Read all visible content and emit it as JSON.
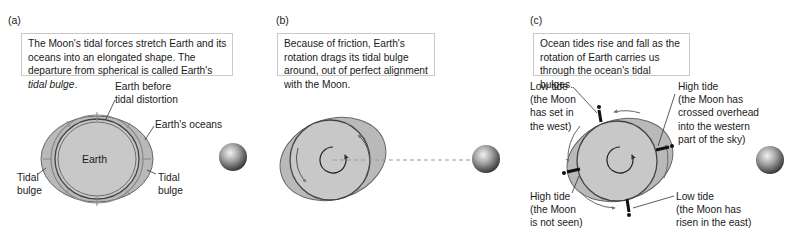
{
  "panels": [
    {
      "id": "a",
      "label": "(a)",
      "caption": {
        "text_before": "The Moon's tidal forces stretch Earth and its oceans into an elongated shape. The departure from spherical is called Earth's ",
        "text_italic": "tidal bulge",
        "text_after": "."
      },
      "labels": {
        "earth_before_1": "Earth before",
        "earth_before_2": "tidal distortion",
        "earths_oceans": "Earth's oceans",
        "earth": "Earth",
        "tidal_left_1": "Tidal",
        "tidal_left_2": "bulge",
        "tidal_right_1": "Tidal",
        "tidal_right_2": "bulge"
      }
    },
    {
      "id": "b",
      "label": "(b)",
      "caption": {
        "text": "Because of friction, Earth's rotation drags its tidal bulge around, out of perfect alignment with the Moon."
      }
    },
    {
      "id": "c",
      "label": "(c)",
      "caption": {
        "text": "Ocean tides rise and fall as the rotation of Earth carries us through the ocean's tidal bulges."
      },
      "labels": {
        "low_tide_west": [
          "Low tide",
          "(the Moon",
          "has set in",
          "the west)"
        ],
        "high_tide_overhead": [
          "High tide",
          "(the Moon has",
          "crossed overhead",
          "into the western",
          "part of the sky)"
        ],
        "high_tide_unseen": [
          "High tide",
          "(the Moon",
          "is not seen)"
        ],
        "low_tide_east": [
          "Low tide",
          "(the Moon has",
          "risen in the east)"
        ]
      }
    }
  ],
  "colors": {
    "ocean_fill": "#b9b9b9",
    "earth_fill": "#c8c8c8",
    "outline": "#555555",
    "caption_border": "#c9c9c9",
    "dashed_line": "#9a9a9a"
  },
  "icons": [
    "moon-icon",
    "rotation-arrow-icon",
    "person-icon"
  ]
}
